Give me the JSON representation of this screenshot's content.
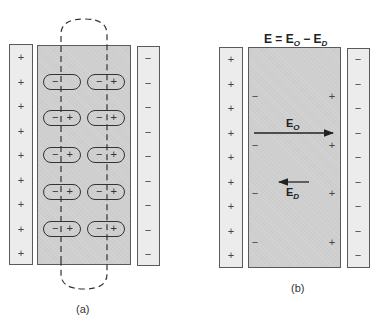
{
  "panel_a": {
    "caption": "(a)",
    "left_plate": {
      "sign": "+",
      "count": 9
    },
    "right_plate": {
      "sign": "−",
      "count": 9
    },
    "dipoles": [
      {
        "row": 1,
        "left": {
          "neg": "−",
          "pos": ""
        },
        "right": {
          "neg": "−",
          "pos": "+"
        }
      },
      {
        "row": 2,
        "left": {
          "neg": "−",
          "pos": "+"
        },
        "right": {
          "neg": "−",
          "pos": "+"
        }
      },
      {
        "row": 3,
        "left": {
          "neg": "−",
          "pos": "+"
        },
        "right": {
          "neg": "−",
          "pos": "+"
        }
      },
      {
        "row": 4,
        "left": {
          "neg": "−",
          "pos": "+"
        },
        "right": {
          "neg": "−",
          "pos": "+"
        }
      },
      {
        "row": 5,
        "left": {
          "neg": "−",
          "pos": "+"
        },
        "right": {
          "neg": "−",
          "pos": "+"
        }
      }
    ]
  },
  "panel_b": {
    "caption": "(b)",
    "title": {
      "lhs": "E = E",
      "sub1": "O",
      "mid": " − E",
      "sub2": "D"
    },
    "left_plate": {
      "sign": "+",
      "count": 9
    },
    "right_plate": {
      "sign": "−",
      "count": 9
    },
    "surface_charges": {
      "left": "−",
      "right": "+"
    },
    "field_applied": {
      "label": "E",
      "sub": "O",
      "direction": "right"
    },
    "field_depolarizing": {
      "label": "E",
      "sub": "D",
      "direction": "left"
    }
  },
  "colors": {
    "plate": "#ececec",
    "dielectric": "#cdcdcd",
    "outline": "#5a5a5a"
  }
}
